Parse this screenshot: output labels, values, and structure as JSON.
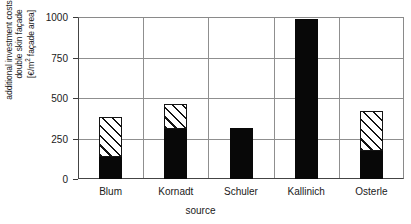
{
  "chart_data": {
    "type": "bar",
    "stacked": true,
    "title": "",
    "subtitle": "",
    "xlabel": "source",
    "ylabel": "additional investment costs for double skin façade [€/m² façade area]",
    "ylabel_lines": [
      "additional investment costs for",
      "double skin façade",
      "[€/m² façade area]"
    ],
    "ylim": [
      0,
      1000
    ],
    "yticks": [
      0,
      250,
      500,
      750,
      1000
    ],
    "ytick_labels": [
      "0",
      "250",
      "500",
      "750",
      "1000"
    ],
    "grid": "horizontal-and-vertical",
    "legend": "none",
    "categories": [
      "Blum",
      "Kornadt",
      "Schuler",
      "Kallinich",
      "Osterle"
    ],
    "series": [
      {
        "name": "lower value (solid black)",
        "fill": "solid-black",
        "values": [
          135,
          310,
          315,
          985,
          170
        ]
      },
      {
        "name": "upper range (hatched)",
        "fill": "diagonal-hatch",
        "values": [
          250,
          155,
          0,
          0,
          250
        ]
      }
    ],
    "bar_totals": [
      385,
      465,
      315,
      985,
      420
    ],
    "colors": {
      "solid": "#080808",
      "hatch_line": "#141414",
      "hatch_background": "#ffffff",
      "grid": "#8f8f8f",
      "axis": "#3a3a3a",
      "background": "#ffffff"
    }
  },
  "axis": {
    "x_title": "source",
    "y_tick_labels": [
      "1000",
      "750",
      "500",
      "250",
      "0"
    ]
  }
}
